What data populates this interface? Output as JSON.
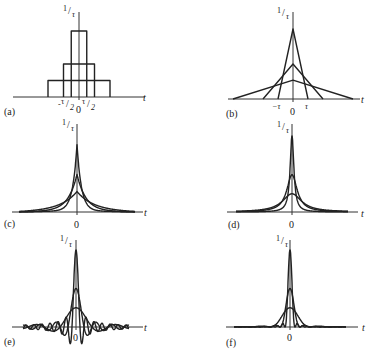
{
  "figure": {
    "background": "#ffffff",
    "ink": "#222222"
  },
  "chart_data": [
    {
      "type": "line",
      "panel": "(a)",
      "title": "Rectangular pulses of unit area",
      "y_axis_label": "1/τ",
      "x_axis_label": "t",
      "tick_labels": [
        "-τ/2",
        "0",
        "τ/2"
      ],
      "shape": "rect",
      "series": [
        {
          "name": "narrow",
          "half_width": 0.5,
          "height": 1.0
        },
        {
          "name": "medium",
          "half_width": 1.0,
          "height": 0.5
        },
        {
          "name": "wide",
          "half_width": 2.0,
          "height": 0.25
        }
      ],
      "layout": {
        "cx": 79,
        "base": 97,
        "xmin": 13,
        "xmax": 145,
        "yaxis_top": 12,
        "unit_x": 15.5,
        "unit_y": 66,
        "label_x": 4,
        "label_y": 115,
        "zero_x": 76,
        "zero_y": 113,
        "t_x": 143,
        "t_y": 101,
        "ylab_x": 63,
        "ylab_y": 14
      }
    },
    {
      "type": "line",
      "panel": "(b)",
      "title": "Triangular pulses of unit area",
      "y_axis_label": "1/τ",
      "x_axis_label": "t",
      "tick_labels": [
        "-τ",
        "0",
        "τ"
      ],
      "shape": "tri",
      "series": [
        {
          "name": "narrow",
          "half_width": 1.0,
          "height": 1.0
        },
        {
          "name": "medium",
          "half_width": 2.0,
          "height": 0.5
        },
        {
          "name": "wide",
          "half_width": 4.0,
          "height": 0.27
        }
      ],
      "layout": {
        "cx": 293,
        "base": 99,
        "xmin": 228,
        "xmax": 360,
        "yaxis_top": 12,
        "unit_x": 15,
        "unit_y": 70,
        "label_x": 226,
        "label_y": 117,
        "zero_x": 290,
        "zero_y": 115,
        "t_x": 361,
        "t_y": 103,
        "ylab_x": 277,
        "ylab_y": 16
      }
    },
    {
      "type": "line",
      "panel": "(c)",
      "title": "Two-sided exponential pulses",
      "y_axis_label": "1/τ",
      "x_axis_label": "t",
      "tick_labels": [
        "0"
      ],
      "shape": "exp",
      "series": [
        {
          "name": "narrow",
          "scale": 8,
          "height": 1.0
        },
        {
          "name": "medium",
          "scale": 16,
          "height": 0.55
        },
        {
          "name": "wide",
          "scale": 30,
          "height": 0.29
        }
      ],
      "layout": {
        "cx": 77,
        "base": 212,
        "xmin": 12,
        "xmax": 143,
        "span": 58,
        "yaxis_top": 124,
        "unit_y": 66,
        "label_x": 4,
        "label_y": 227,
        "zero_x": 74,
        "zero_y": 228,
        "t_x": 144,
        "t_y": 216,
        "ylab_x": 62,
        "ylab_y": 128
      }
    },
    {
      "type": "line",
      "panel": "(d)",
      "title": "Lorentzian (Cauchy) pulses",
      "y_axis_label": "1/τ",
      "x_axis_label": "t",
      "tick_labels": [
        "0"
      ],
      "shape": "lorentz",
      "series": [
        {
          "name": "narrow",
          "scale": 5,
          "height": 1.0
        },
        {
          "name": "medium",
          "scale": 14,
          "height": 0.49
        },
        {
          "name": "wide",
          "scale": 26,
          "height": 0.24
        }
      ],
      "layout": {
        "cx": 292,
        "base": 212,
        "xmin": 227,
        "xmax": 358,
        "span": 56,
        "yaxis_top": 124,
        "unit_y": 76,
        "label_x": 228,
        "label_y": 228,
        "zero_x": 289,
        "zero_y": 228,
        "t_x": 361,
        "t_y": 217,
        "ylab_x": 277,
        "ylab_y": 130
      }
    },
    {
      "type": "line",
      "panel": "(e)",
      "title": "sinc pulses",
      "y_axis_label": "1/τ",
      "x_axis_label": "t",
      "tick_labels": [
        "0"
      ],
      "shape": "sinc",
      "series": [
        {
          "name": "narrow",
          "zero_spacing": 4,
          "height": 1.0
        },
        {
          "name": "medium",
          "zero_spacing": 8,
          "height": 0.5
        },
        {
          "name": "wide",
          "zero_spacing": 16,
          "height": 0.25
        }
      ],
      "layout": {
        "cx": 76,
        "base": 327,
        "xmin": 12,
        "xmax": 143,
        "span": 53,
        "yaxis_top": 240,
        "unit_y": 77,
        "label_x": 4,
        "label_y": 345,
        "zero_x": 73,
        "zero_y": 341,
        "t_x": 144,
        "t_y": 331,
        "ylab_x": 60,
        "ylab_y": 244
      }
    },
    {
      "type": "line",
      "panel": "(f)",
      "title": "sinc-squared pulses",
      "y_axis_label": "1/τ",
      "x_axis_label": "t",
      "tick_labels": [
        "0"
      ],
      "shape": "sinc2",
      "series": [
        {
          "name": "narrow",
          "zero_spacing": 5,
          "height": 1.0
        },
        {
          "name": "medium",
          "zero_spacing": 10,
          "height": 0.5
        },
        {
          "name": "wide",
          "zero_spacing": 20,
          "height": 0.25
        }
      ],
      "layout": {
        "cx": 290,
        "base": 327,
        "xmin": 226,
        "xmax": 358,
        "span": 56,
        "yaxis_top": 240,
        "unit_y": 77,
        "label_x": 226,
        "label_y": 346,
        "zero_x": 287,
        "zero_y": 341,
        "t_x": 362,
        "t_y": 331,
        "ylab_x": 276,
        "ylab_y": 244
      }
    }
  ]
}
